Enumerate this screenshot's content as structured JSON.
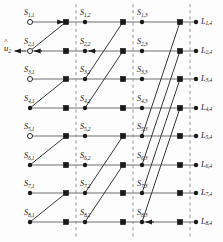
{
  "figure": {
    "n_rows": 8,
    "n_columns": 4,
    "stages": 3
  },
  "chart_data": {
    "type": "diagram",
    "rows": 8,
    "columns": 4,
    "column_x": [
      30,
      85,
      142,
      196
    ],
    "square_x": [
      66,
      123,
      180
    ],
    "dash_x": [
      76,
      133,
      190
    ],
    "row_y": [
      22,
      51,
      79,
      108,
      136,
      165,
      193,
      222
    ],
    "stage_spans": [
      1,
      2,
      4
    ],
    "open_circle_rows": [
      1,
      2,
      3,
      5
    ],
    "arrow_nodes": [
      "S_2,1",
      "S_8,3"
    ],
    "axis_note": "left column = decoded bits u-hat, right column = channel LLR L"
  },
  "labels": {
    "column1": [
      "S",
      "S",
      "S",
      "S",
      "S",
      "S",
      "S",
      "S"
    ],
    "col1_subs": [
      "1,1",
      "2,1",
      "3,1",
      "4,1",
      "5,1",
      "6,1",
      "7,1",
      "8,1"
    ],
    "col2_subs": [
      "1,2",
      "2,2",
      "3,2",
      "4,2",
      "5,2",
      "6,2",
      "7,2",
      "8,2"
    ],
    "col3_subs": [
      "1,3",
      "2,3",
      "3,3",
      "4,3",
      "5,3",
      "6,3",
      "7,3",
      "8,3"
    ],
    "col4_subs": [
      "1,4",
      "2,4",
      "3,4",
      "4,4",
      "5,4",
      "6,4",
      "7,4",
      "8,4"
    ],
    "col4_symbol": "L",
    "s_symbol": "S",
    "u_symbol": "u",
    "u_sub": "2"
  },
  "colors": {
    "node_fill": "#1a1a1a",
    "open_node_stroke": "#2b2b2b",
    "open_node_fill": "#ffffff",
    "edge": "#6e6e6e",
    "diagonal_edge": "#3a3a3a",
    "dashed_line": "#8a8a8a",
    "text": "#1b1b1b",
    "background": "#fdfdfd"
  }
}
